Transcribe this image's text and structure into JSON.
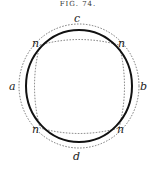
{
  "figure": {
    "title": "FIG. 74.",
    "labels": {
      "a": "a",
      "b": "b",
      "c": "c",
      "d": "d",
      "n1": "n",
      "n2": "n",
      "n3": "n",
      "n4": "n"
    }
  }
}
